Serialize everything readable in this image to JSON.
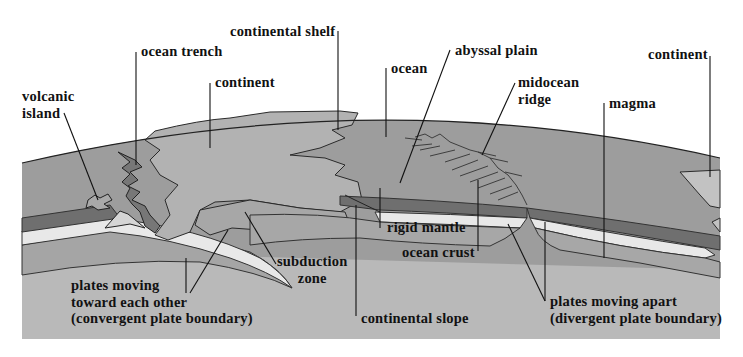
{
  "diagram": {
    "colors": {
      "background": "#ffffff",
      "ocean_water": "#9c9c9c",
      "continent": "#b0b0b0",
      "rigid_mantle_dark": "#6e6e6e",
      "ocean_crust_light": "#e6e6e6",
      "lower_plate": "#a2a2a2",
      "magma": "#b8b8b8",
      "outline": "#222222",
      "text": "#111111"
    },
    "labels": {
      "continental_shelf": "continental shelf",
      "ocean_trench": "ocean trench",
      "continent_left": "continent",
      "volcanic_island": [
        "volcanic",
        "island"
      ],
      "ocean": "ocean",
      "abyssal_plain": "abyssal plain",
      "midocean_ridge": [
        "midocean",
        "ridge"
      ],
      "magma": "magma",
      "continent_right": "continent",
      "rigid_mantle": "rigid mantle",
      "ocean_crust": "ocean crust",
      "subduction_zone": [
        "subduction",
        "zone"
      ],
      "convergent": [
        "plates moving",
        "toward each other",
        "(convergent plate boundary)"
      ],
      "continental_slope": "continental slope",
      "divergent": [
        "plates moving apart",
        "(divergent plate boundary)"
      ]
    }
  }
}
